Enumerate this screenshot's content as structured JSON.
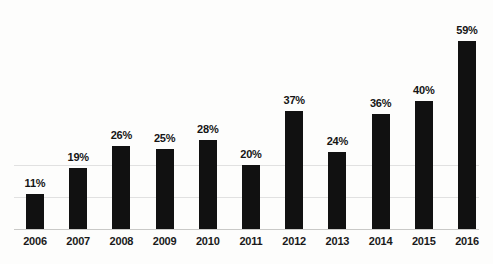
{
  "chart_data": {
    "type": "bar",
    "title": "",
    "subtitle": "",
    "xlabel": "",
    "ylabel": "",
    "categories": [
      "2006",
      "2007",
      "2008",
      "2009",
      "2010",
      "2011",
      "2012",
      "2013",
      "2014",
      "2015",
      "2016"
    ],
    "values": [
      11,
      19,
      26,
      25,
      28,
      20,
      37,
      24,
      36,
      40,
      59
    ],
    "data_labels": [
      "11%",
      "19%",
      "26%",
      "25%",
      "28%",
      "20%",
      "37%",
      "24%",
      "36%",
      "40%",
      "59%"
    ],
    "value_suffix": "%",
    "ylim": [
      0,
      62
    ],
    "grid": true,
    "gridlines_at": [
      10,
      20
    ],
    "legend": "none",
    "bar_color": "#111111",
    "axis_color": "#c9c9c7",
    "grid_color": "#dcdcdc",
    "background_color": "#fdfdfc",
    "label_color": "#151515"
  },
  "axes": {
    "x_tick_labels": [
      "2006",
      "2007",
      "2008",
      "2009",
      "2010",
      "2011",
      "2012",
      "2013",
      "2014",
      "2015",
      "2016"
    ],
    "y_tick_labels": []
  }
}
